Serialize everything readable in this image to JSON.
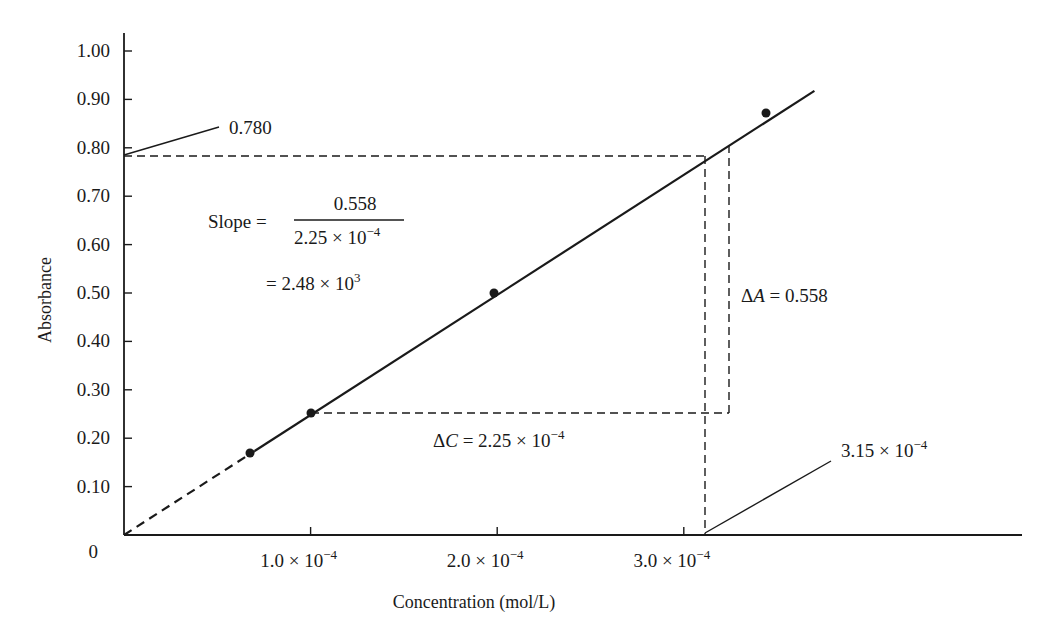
{
  "chart_data": {
    "type": "line",
    "title": "",
    "xlabel": "Concentration (mol/L)",
    "ylabel": "Absorbance",
    "xlim": [
      0,
      0.00048
    ],
    "ylim": [
      0,
      1.03
    ],
    "grid": false,
    "legend": null,
    "x_ticks": [
      {
        "value": 0.0001,
        "mantissa": "1.0",
        "exp": "−4"
      },
      {
        "value": 0.0002,
        "mantissa": "2.0",
        "exp": "−4"
      },
      {
        "value": 0.0003,
        "mantissa": "3.0",
        "exp": "−4"
      }
    ],
    "y_ticks": [
      "0",
      "0.10",
      "0.20",
      "0.30",
      "0.40",
      "0.50",
      "0.60",
      "0.70",
      "0.80",
      "0.90",
      "1.00"
    ],
    "series": [
      {
        "name": "Calibration data",
        "x": [
          7e-05,
          0.0001,
          0.0002,
          0.00034
        ],
        "y": [
          0.172,
          0.252,
          0.502,
          0.875
        ]
      }
    ],
    "fit_line": {
      "slope": 2480,
      "intercept": 0,
      "dashed_segment_x": [
        0,
        7e-05
      ],
      "solid_segment_x": [
        7e-05,
        0.00037
      ]
    },
    "annotations": {
      "absorbance_callout": "0.780",
      "concentration_callout": {
        "mantissa": "3.15",
        "exp": "−4"
      },
      "unknown_point": {
        "x": 0.000315,
        "y": 0.78
      },
      "delta_A": {
        "label": "ΔA",
        "value": "0.558"
      },
      "delta_C": {
        "label": "ΔC",
        "mantissa": "2.25",
        "exp": "−4"
      },
      "slope_label": "Slope =",
      "slope_numerator": "0.558",
      "slope_denominator": {
        "mantissa": "2.25",
        "exp": "−4"
      },
      "slope_result": {
        "prefix": "=",
        "mantissa": "2.48",
        "exp": "3"
      }
    }
  }
}
